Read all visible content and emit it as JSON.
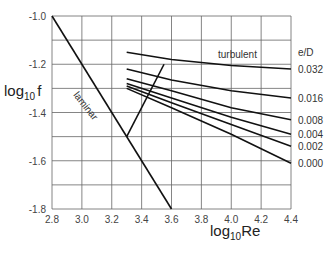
{
  "chart_data": {
    "type": "line",
    "title": "",
    "xlabel": "log10 Re",
    "ylabel": "log10 f",
    "xlim": [
      2.8,
      4.4
    ],
    "ylim": [
      -1.8,
      -1.0
    ],
    "grid": true,
    "x_ticks": [
      "2.8",
      "3.0",
      "3.2",
      "3.4",
      "3.6",
      "3.8",
      "4.0",
      "4.2",
      "4.4"
    ],
    "y_ticks": [
      "-1.0",
      "-1.2",
      "-1.4",
      "-1.6",
      "-1.8"
    ],
    "legend_title": "e/D",
    "annotations": [
      "laminar",
      "turbulent"
    ],
    "series": [
      {
        "name": "laminar",
        "x": [
          2.8,
          3.6
        ],
        "y": [
          -1.0,
          -1.8
        ]
      },
      {
        "name": "transition",
        "x": [
          3.3,
          3.55
        ],
        "y": [
          -1.5,
          -1.2
        ]
      },
      {
        "name": "0.032",
        "x": [
          3.3,
          3.6,
          4.0,
          4.4
        ],
        "y": [
          -1.15,
          -1.18,
          -1.205,
          -1.22
        ]
      },
      {
        "name": "0.016",
        "x": [
          3.3,
          3.6,
          4.0,
          4.4
        ],
        "y": [
          -1.22,
          -1.265,
          -1.31,
          -1.34
        ]
      },
      {
        "name": "0.008",
        "x": [
          3.3,
          3.6,
          4.0,
          4.4
        ],
        "y": [
          -1.26,
          -1.31,
          -1.38,
          -1.43
        ]
      },
      {
        "name": "0.004",
        "x": [
          3.3,
          3.6,
          4.0,
          4.4
        ],
        "y": [
          -1.28,
          -1.34,
          -1.42,
          -1.49
        ]
      },
      {
        "name": "0.002",
        "x": [
          3.3,
          3.6,
          4.0,
          4.4
        ],
        "y": [
          -1.29,
          -1.36,
          -1.45,
          -1.54
        ]
      },
      {
        "name": "0.000",
        "x": [
          3.3,
          3.6,
          4.0,
          4.4
        ],
        "y": [
          -1.3,
          -1.38,
          -1.49,
          -1.61
        ]
      }
    ]
  },
  "labels": {
    "ylabel_main": "log",
    "ylabel_sub": "10",
    "ylabel_var": "f",
    "xlabel_main": "log",
    "xlabel_sub": "10",
    "xlabel_var": "Re",
    "laminar": "laminar",
    "turbulent": "turbulent",
    "legend_title": "e/D"
  }
}
